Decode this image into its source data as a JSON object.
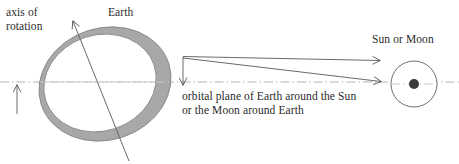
{
  "figure": {
    "type": "astronomy-diagram",
    "width": 459,
    "height": 164,
    "background": "#ffffff",
    "labels": {
      "axis_of_rotation": "axis of\nrotation",
      "earth": "Earth",
      "sun_or_moon": "Sun or Moon",
      "orbital_plane": "orbital plane of Earth around the Sun\nor the Moon around Earth"
    },
    "colors": {
      "text": "#2b2b2b",
      "line": "#4a4a4a",
      "earth_shade": "#a8a8a8",
      "earth_shade_stroke": "#8a8a8a",
      "earth_lit": "#ffffff",
      "orbital_plane_line": "#b5b5b5",
      "body_outline": "#6e6e6e",
      "body_center_dot": "#3a3a3a"
    },
    "geometry": {
      "earth_outer_ellipse": {
        "cx": 105,
        "cy": 84,
        "rx": 67,
        "ry": 56,
        "rotation_deg": -18
      },
      "earth_inner_ellipse": {
        "cx": 100,
        "cy": 83,
        "rx": 57,
        "ry": 48,
        "rotation_deg": -18
      },
      "rotation_axis_line": {
        "x1": 73,
        "y1": 21,
        "x2": 129,
        "y2": 161,
        "arrow_at": "start"
      },
      "orbital_plane_line": {
        "x1": 0,
        "y1": 82,
        "x2": 459,
        "y2": 82,
        "style": "dash-dot"
      },
      "vertical_up_arrow": {
        "x": 17,
        "y1": 114,
        "y2": 84
      },
      "angle_vertex": {
        "x": 183,
        "y": 57
      },
      "angle_down_arrow": {
        "x": 183,
        "y1": 57,
        "y2": 84
      },
      "ray_upper": {
        "x1": 183,
        "y1": 57,
        "x2": 383,
        "y2": 61
      },
      "ray_lower": {
        "x1": 183,
        "y1": 58,
        "x2": 383,
        "y2": 82
      },
      "sun_or_moon_circle": {
        "cx": 414,
        "cy": 84,
        "r": 23
      },
      "sun_or_moon_dot": {
        "cx": 414,
        "cy": 84,
        "r": 5
      }
    }
  }
}
